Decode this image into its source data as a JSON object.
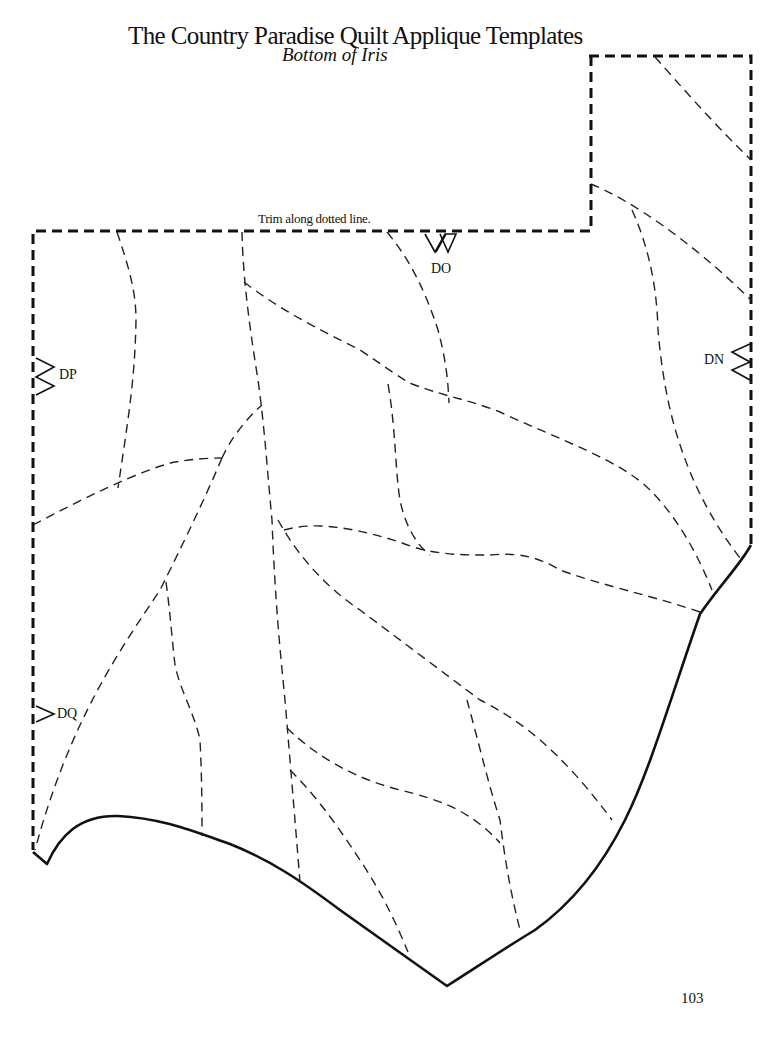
{
  "header": {
    "title": "The Country Paradise Quilt Applique Templates",
    "subtitle": "Bottom of Iris"
  },
  "template": {
    "trim_instruction": "Trim along dotted line.",
    "notch_labels": {
      "top": "DO",
      "left_upper": "DP",
      "right": "DN",
      "left_lower": "DQ"
    },
    "line_styles": {
      "cut_line": "heavy dashed",
      "seam_lines": "light dashed",
      "edge": "solid"
    },
    "colors": {
      "ink": "#111111",
      "paper": "#ffffff"
    }
  },
  "footer": {
    "page_number": "103"
  }
}
